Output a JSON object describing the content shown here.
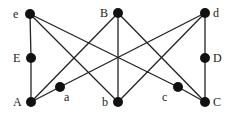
{
  "diagram": {
    "type": "graph",
    "nodes": [
      {
        "id": "e",
        "label": "e",
        "x": 30,
        "y": 14,
        "label_x": 13,
        "label_y": 18
      },
      {
        "id": "E",
        "label": "E",
        "x": 31,
        "y": 58,
        "label_x": 13,
        "label_y": 62
      },
      {
        "id": "A",
        "label": "A",
        "x": 31,
        "y": 102,
        "label_x": 13,
        "label_y": 106
      },
      {
        "id": "a",
        "label": "a",
        "x": 60,
        "y": 87,
        "label_x": 64,
        "label_y": 101
      },
      {
        "id": "B",
        "label": "B",
        "x": 118,
        "y": 13,
        "label_x": 100,
        "label_y": 17
      },
      {
        "id": "b",
        "label": "b",
        "x": 118,
        "y": 102,
        "label_x": 102,
        "label_y": 106
      },
      {
        "id": "c",
        "label": "c",
        "x": 178,
        "y": 87,
        "label_x": 162,
        "label_y": 101
      },
      {
        "id": "d",
        "label": "d",
        "x": 205,
        "y": 13,
        "label_x": 213,
        "label_y": 17
      },
      {
        "id": "D",
        "label": "D",
        "x": 205,
        "y": 58,
        "label_x": 213,
        "label_y": 62
      },
      {
        "id": "C",
        "label": "C",
        "x": 205,
        "y": 102,
        "label_x": 213,
        "label_y": 106
      }
    ],
    "edges": [
      [
        "e",
        "E"
      ],
      [
        "E",
        "A"
      ],
      [
        "e",
        "b"
      ],
      [
        "e",
        "c"
      ],
      [
        "c",
        "C"
      ],
      [
        "A",
        "B"
      ],
      [
        "A",
        "a"
      ],
      [
        "a",
        "d"
      ],
      [
        "B",
        "b"
      ],
      [
        "B",
        "C"
      ],
      [
        "b",
        "d"
      ],
      [
        "d",
        "D"
      ],
      [
        "D",
        "C"
      ]
    ]
  }
}
